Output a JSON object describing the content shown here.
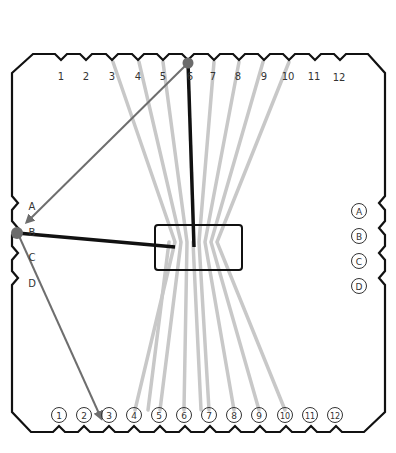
{
  "diagram": {
    "title": "",
    "colors": {
      "outline": "#111111",
      "thread_light": "#c8c8c8",
      "thread_dark": "#111111",
      "arrow": "#6e6e6e",
      "pivot": "#6b6b6b",
      "label": "#333333"
    },
    "top_labels": [
      "1",
      "2",
      "3",
      "4",
      "5",
      "6",
      "7",
      "8",
      "9",
      "10",
      "11",
      "12"
    ],
    "bottom_labels": [
      "1",
      "2",
      "3",
      "4",
      "5",
      "6",
      "7",
      "8",
      "9",
      "10",
      "11",
      "12"
    ],
    "left_labels": [
      "A",
      "B",
      "C",
      "D"
    ],
    "right_labels": [
      "A",
      "B",
      "C",
      "D"
    ],
    "center_box": {
      "label": ""
    },
    "annotations": {
      "pivot_top": "6",
      "pivot_left": "B",
      "arrow_1": "from top 6 to left B",
      "arrow_2": "from left B to bottom 3"
    }
  }
}
